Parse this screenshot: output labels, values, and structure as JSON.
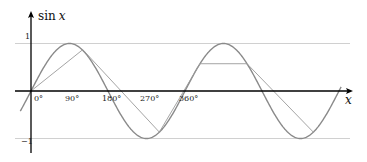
{
  "chart_data": {
    "type": "line",
    "title": "",
    "xlabel": "x",
    "ylabel_fn": "sin",
    "ylabel_var": "x",
    "function": "sin x",
    "x_unit": "degrees",
    "xlim": [
      -25,
      725
    ],
    "ylim": [
      -1,
      1
    ],
    "grid": "horizontal lines at y = 1 and y = -1",
    "x_ticks": [
      {
        "value": 0,
        "label": "0°"
      },
      {
        "value": 90,
        "label": "90°"
      },
      {
        "value": 180,
        "label": "180°"
      },
      {
        "value": 270,
        "label": "270°"
      },
      {
        "value": 360,
        "label": "360°"
      }
    ],
    "y_ticks": [
      {
        "value": 1,
        "label": "1"
      },
      {
        "value": -1,
        "label": "−1"
      }
    ],
    "series": [
      {
        "name": "sin x",
        "kind": "curve",
        "color": "#8a8a8a",
        "x_start": -25,
        "x_end": 725
      },
      {
        "name": "chord polyline",
        "kind": "polyline",
        "color": "#9a9a9a",
        "points": [
          [
            0,
            0
          ],
          [
            121,
            0.87
          ],
          [
            300,
            -0.866
          ],
          [
            395,
            0.574
          ],
          [
            505,
            0.574
          ],
          [
            660,
            -0.866
          ]
        ]
      }
    ],
    "colors": {
      "axis": "#000000",
      "grid": "#d0d0d0",
      "curve": "#8a8a8a",
      "chord": "#9a9a9a"
    }
  }
}
